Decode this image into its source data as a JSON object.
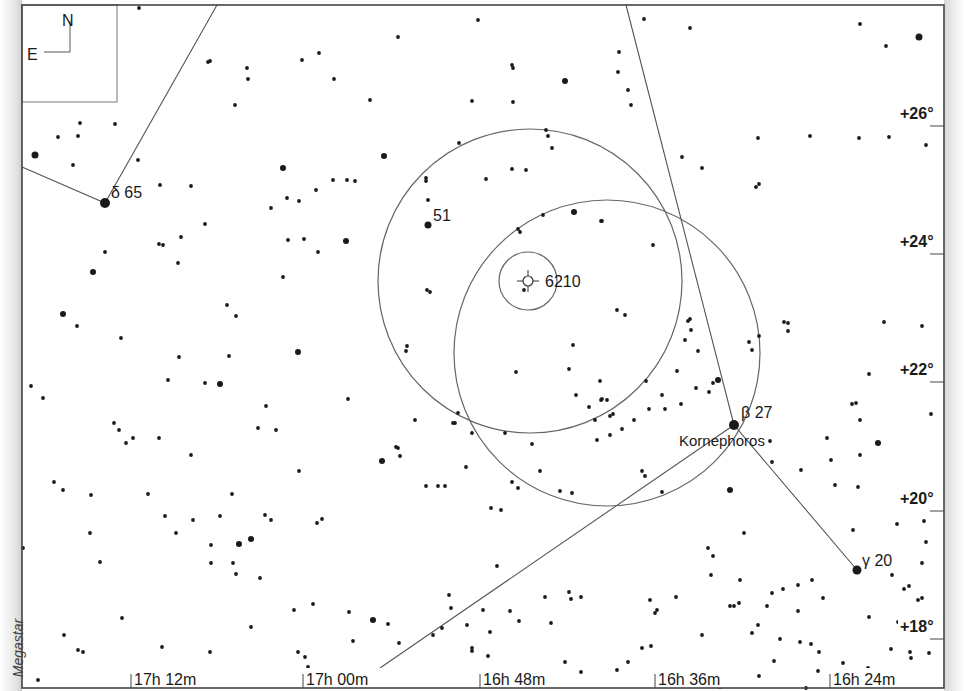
{
  "chart_title": "Finder chart — NGC 6210 in Hercules",
  "credit": "Megastar",
  "compass": {
    "north": "N",
    "east": "E"
  },
  "frame": {
    "left": 22,
    "top": 5,
    "right": 944,
    "bottom": 688
  },
  "ra_labels": [
    {
      "label": "17h 12m",
      "x": 131
    },
    {
      "label": "17h 00m",
      "x": 303
    },
    {
      "label": "16h 48m",
      "x": 480
    },
    {
      "label": "16h 36m",
      "x": 655
    },
    {
      "label": "16h 24m",
      "x": 830
    }
  ],
  "dec_labels": [
    {
      "label": "+26°",
      "y": 116
    },
    {
      "label": "+24°",
      "y": 244
    },
    {
      "label": "+22°",
      "y": 372
    },
    {
      "label": "+20°",
      "y": 501
    },
    {
      "label": "+18°",
      "y": 629
    }
  ],
  "object_labels": [
    {
      "id": "ngc6210",
      "label": "6210",
      "x": 545,
      "y": 287
    },
    {
      "id": "star-51",
      "label": "51",
      "x": 433,
      "y": 221
    },
    {
      "id": "delta-her",
      "label": "δ 65",
      "x": 111,
      "y": 198
    },
    {
      "id": "beta-her",
      "label": "β  27",
      "x": 741,
      "y": 418
    },
    {
      "id": "kornephoros",
      "label": "Kornephoros",
      "x": 679,
      "y": 446
    },
    {
      "id": "gamma-her",
      "label": "γ 20",
      "x": 862,
      "y": 566
    }
  ],
  "target": {
    "name": "NGC 6210",
    "x": 528,
    "y": 281
  },
  "fov_circles": [
    {
      "cx": 528,
      "cy": 281,
      "r": 29
    },
    {
      "cx": 530,
      "cy": 281,
      "r": 152
    },
    {
      "cx": 607,
      "cy": 353,
      "r": 153
    }
  ],
  "constellation_lines": [
    [
      [
        22,
        167
      ],
      [
        105,
        203
      ],
      [
        217,
        5
      ]
    ],
    [
      [
        626,
        5
      ],
      [
        734,
        425
      ],
      [
        857,
        570
      ]
    ],
    [
      [
        380,
        668
      ],
      [
        734,
        425
      ]
    ]
  ],
  "bright_stars": [
    {
      "x": 105,
      "y": 203,
      "r": 5
    },
    {
      "x": 734,
      "y": 425,
      "r": 5
    },
    {
      "x": 857,
      "y": 570,
      "r": 4.5
    },
    {
      "x": 428,
      "y": 225,
      "r": 3.5
    },
    {
      "x": 919,
      "y": 37,
      "r": 3.5
    },
    {
      "x": 35,
      "y": 155,
      "r": 3.5
    },
    {
      "x": 93,
      "y": 272,
      "r": 3
    },
    {
      "x": 63,
      "y": 314,
      "r": 3
    },
    {
      "x": 298,
      "y": 352,
      "r": 3
    },
    {
      "x": 346,
      "y": 241,
      "r": 3
    },
    {
      "x": 384,
      "y": 156,
      "r": 3
    },
    {
      "x": 283,
      "y": 168,
      "r": 3
    },
    {
      "x": 565,
      "y": 81,
      "r": 3
    },
    {
      "x": 574,
      "y": 212,
      "r": 3
    },
    {
      "x": 718,
      "y": 380,
      "r": 3
    },
    {
      "x": 730,
      "y": 490,
      "r": 3
    },
    {
      "x": 878,
      "y": 443,
      "r": 3
    },
    {
      "x": 382,
      "y": 461,
      "r": 3
    },
    {
      "x": 239,
      "y": 544,
      "r": 3
    },
    {
      "x": 251,
      "y": 539,
      "r": 3
    },
    {
      "x": 373,
      "y": 620,
      "r": 3
    },
    {
      "x": 220,
      "y": 384,
      "r": 3
    }
  ],
  "faint_stars": [
    [
      139,
      8
    ],
    [
      208,
      62
    ],
    [
      210,
      61
    ],
    [
      247,
      68
    ],
    [
      248,
      79
    ],
    [
      235,
      105
    ],
    [
      302,
      60
    ],
    [
      319,
      53
    ],
    [
      334,
      79
    ],
    [
      370,
      100
    ],
    [
      398,
      37
    ],
    [
      478,
      20
    ],
    [
      512,
      65
    ],
    [
      513,
      68
    ],
    [
      565,
      81
    ],
    [
      472,
      101
    ],
    [
      513,
      102
    ],
    [
      526,
      170
    ],
    [
      644,
      19
    ],
    [
      690,
      28
    ],
    [
      619,
      52
    ],
    [
      618,
      72
    ],
    [
      628,
      90
    ],
    [
      631,
      105
    ],
    [
      860,
      24
    ],
    [
      886,
      46
    ],
    [
      859,
      138
    ],
    [
      889,
      137
    ],
    [
      926,
      145
    ],
    [
      758,
      138
    ],
    [
      810,
      136
    ],
    [
      682,
      157
    ],
    [
      702,
      168
    ],
    [
      756,
      187
    ],
    [
      759,
      184
    ],
    [
      80,
      123
    ],
    [
      58,
      137
    ],
    [
      78,
      136
    ],
    [
      73,
      165
    ],
    [
      115,
      124
    ],
    [
      138,
      160
    ],
    [
      160,
      185
    ],
    [
      191,
      186
    ],
    [
      205,
      224
    ],
    [
      181,
      237
    ],
    [
      159,
      244
    ],
    [
      163,
      245
    ],
    [
      178,
      263
    ],
    [
      271,
      208
    ],
    [
      287,
      198
    ],
    [
      299,
      201
    ],
    [
      288,
      240
    ],
    [
      304,
      239
    ],
    [
      318,
      252
    ],
    [
      283,
      277
    ],
    [
      227,
      305
    ],
    [
      236,
      316
    ],
    [
      229,
      356
    ],
    [
      316,
      190
    ],
    [
      333,
      180
    ],
    [
      347,
      180
    ],
    [
      355,
      181
    ],
    [
      426,
      181
    ],
    [
      427,
      290
    ],
    [
      430,
      292
    ],
    [
      105,
      252
    ],
    [
      93,
      272
    ],
    [
      77,
      326
    ],
    [
      121,
      338
    ],
    [
      179,
      357
    ],
    [
      168,
      380
    ],
    [
      205,
      383
    ],
    [
      266,
      406
    ],
    [
      258,
      428
    ],
    [
      276,
      430
    ],
    [
      348,
      399
    ],
    [
      299,
      471
    ],
    [
      317,
      523
    ],
    [
      220,
      516
    ],
    [
      176,
      533
    ],
    [
      211,
      563
    ],
    [
      211,
      545
    ],
    [
      31,
      386
    ],
    [
      43,
      398
    ],
    [
      54,
      482
    ],
    [
      63,
      490
    ],
    [
      91,
      495
    ],
    [
      114,
      423
    ],
    [
      119,
      430
    ],
    [
      126,
      443
    ],
    [
      133,
      438
    ],
    [
      159,
      438
    ],
    [
      191,
      455
    ],
    [
      232,
      494
    ],
    [
      265,
      515
    ],
    [
      271,
      520
    ],
    [
      233,
      563
    ],
    [
      23,
      548
    ],
    [
      90,
      533
    ],
    [
      100,
      562
    ],
    [
      148,
      494
    ],
    [
      165,
      516
    ],
    [
      193,
      520
    ],
    [
      236,
      574
    ],
    [
      260,
      578
    ],
    [
      294,
      610
    ],
    [
      322,
      519
    ],
    [
      415,
      420
    ],
    [
      398,
      448
    ],
    [
      400,
      456
    ],
    [
      426,
      486
    ],
    [
      445,
      486
    ],
    [
      438,
      486
    ],
    [
      396,
      447
    ],
    [
      407,
      346
    ],
    [
      406,
      351
    ],
    [
      458,
      413
    ],
    [
      453,
      423
    ],
    [
      466,
      467
    ],
    [
      491,
      508
    ],
    [
      501,
      510
    ],
    [
      512,
      482
    ],
    [
      518,
      488
    ],
    [
      540,
      471
    ],
    [
      497,
      566
    ],
    [
      560,
      491
    ],
    [
      572,
      493
    ],
    [
      545,
      597
    ],
    [
      569,
      592
    ],
    [
      571,
      599
    ],
    [
      551,
      623
    ],
    [
      581,
      597
    ],
    [
      483,
      610
    ],
    [
      472,
      651
    ],
    [
      472,
      648
    ],
    [
      488,
      656
    ],
    [
      546,
      130
    ],
    [
      552,
      148
    ],
    [
      548,
      136
    ],
    [
      512,
      169
    ],
    [
      486,
      179
    ],
    [
      426,
      178
    ],
    [
      459,
      143
    ],
    [
      428,
      200
    ],
    [
      455,
      423
    ],
    [
      472,
      433
    ],
    [
      505,
      433
    ],
    [
      532,
      444
    ],
    [
      516,
      372
    ],
    [
      569,
      369
    ],
    [
      595,
      420
    ],
    [
      573,
      345
    ],
    [
      600,
      381
    ],
    [
      601,
      400
    ],
    [
      576,
      395
    ],
    [
      607,
      400
    ],
    [
      613,
      414
    ],
    [
      597,
      440
    ],
    [
      649,
      409
    ],
    [
      622,
      429
    ],
    [
      602,
      399
    ],
    [
      610,
      416
    ],
    [
      589,
      407
    ],
    [
      610,
      435
    ],
    [
      625,
      315
    ],
    [
      653,
      245
    ],
    [
      601,
      221
    ],
    [
      602,
      221
    ],
    [
      543,
      215
    ],
    [
      518,
      229
    ],
    [
      520,
      232
    ],
    [
      524,
      290
    ],
    [
      617,
      310
    ],
    [
      645,
      476
    ],
    [
      642,
      471
    ],
    [
      662,
      492
    ],
    [
      688,
      321
    ],
    [
      690,
      319
    ],
    [
      709,
      392
    ],
    [
      749,
      342
    ],
    [
      752,
      350
    ],
    [
      759,
      336
    ],
    [
      634,
      420
    ],
    [
      646,
      381
    ],
    [
      665,
      409
    ],
    [
      713,
      383
    ],
    [
      681,
      404
    ],
    [
      677,
      371
    ],
    [
      662,
      395
    ],
    [
      685,
      340
    ],
    [
      691,
      330
    ],
    [
      698,
      351
    ],
    [
      696,
      388
    ],
    [
      770,
      441
    ],
    [
      772,
      462
    ],
    [
      788,
      331
    ],
    [
      784,
      322
    ],
    [
      788,
      323
    ],
    [
      801,
      470
    ],
    [
      827,
      438
    ],
    [
      831,
      460
    ],
    [
      852,
      404
    ],
    [
      856,
      403
    ],
    [
      860,
      420
    ],
    [
      869,
      374
    ],
    [
      884,
      322
    ],
    [
      922,
      326
    ],
    [
      923,
      357
    ],
    [
      860,
      455
    ],
    [
      858,
      487
    ],
    [
      853,
      530
    ],
    [
      835,
      485
    ],
    [
      744,
      533
    ],
    [
      798,
      611
    ],
    [
      812,
      580
    ],
    [
      798,
      585
    ],
    [
      823,
      598
    ],
    [
      713,
      556
    ],
    [
      708,
      548
    ],
    [
      711,
      575
    ],
    [
      740,
      580
    ],
    [
      739,
      603
    ],
    [
      772,
      593
    ],
    [
      758,
      625
    ],
    [
      780,
      639
    ],
    [
      811,
      644
    ],
    [
      774,
      661
    ],
    [
      897,
      524
    ],
    [
      924,
      521
    ],
    [
      926,
      542
    ],
    [
      892,
      575
    ],
    [
      909,
      586
    ],
    [
      918,
      600
    ],
    [
      869,
      617
    ],
    [
      898,
      622
    ],
    [
      904,
      589
    ],
    [
      922,
      563
    ],
    [
      922,
      598
    ],
    [
      911,
      658
    ],
    [
      928,
      499
    ],
    [
      931,
      414
    ],
    [
      931,
      490
    ],
    [
      650,
      600
    ],
    [
      655,
      613
    ],
    [
      657,
      610
    ],
    [
      676,
      597
    ],
    [
      702,
      635
    ],
    [
      730,
      606
    ],
    [
      752,
      633
    ],
    [
      767,
      606
    ],
    [
      734,
      606
    ],
    [
      783,
      589
    ],
    [
      720,
      687
    ],
    [
      806,
      688
    ],
    [
      818,
      671
    ],
    [
      843,
      663
    ],
    [
      910,
      652
    ],
    [
      929,
      653
    ],
    [
      64,
      635
    ],
    [
      78,
      650
    ],
    [
      83,
      652
    ],
    [
      122,
      618
    ],
    [
      162,
      647
    ],
    [
      210,
      652
    ],
    [
      251,
      627
    ],
    [
      298,
      652
    ],
    [
      305,
      657
    ],
    [
      308,
      667
    ],
    [
      313,
      604
    ],
    [
      349,
      612
    ],
    [
      353,
      641
    ],
    [
      372,
      620
    ],
    [
      388,
      624
    ],
    [
      399,
      643
    ],
    [
      433,
      635
    ],
    [
      442,
      628
    ],
    [
      449,
      595
    ],
    [
      451,
      608
    ],
    [
      467,
      625
    ],
    [
      490,
      632
    ],
    [
      519,
      621
    ],
    [
      510,
      611
    ],
    [
      565,
      662
    ],
    [
      581,
      672
    ],
    [
      617,
      670
    ],
    [
      628,
      662
    ],
    [
      642,
      648
    ],
    [
      651,
      646
    ],
    [
      686,
      672
    ],
    [
      713,
      670
    ],
    [
      759,
      676
    ],
    [
      800,
      642
    ],
    [
      819,
      652
    ],
    [
      845,
      675
    ],
    [
      868,
      668
    ],
    [
      891,
      649
    ],
    [
      38,
      680
    ]
  ],
  "colors": {
    "star": "#1a1a1a",
    "line": "#555555",
    "frame": "#444444",
    "circle": "#666666"
  }
}
